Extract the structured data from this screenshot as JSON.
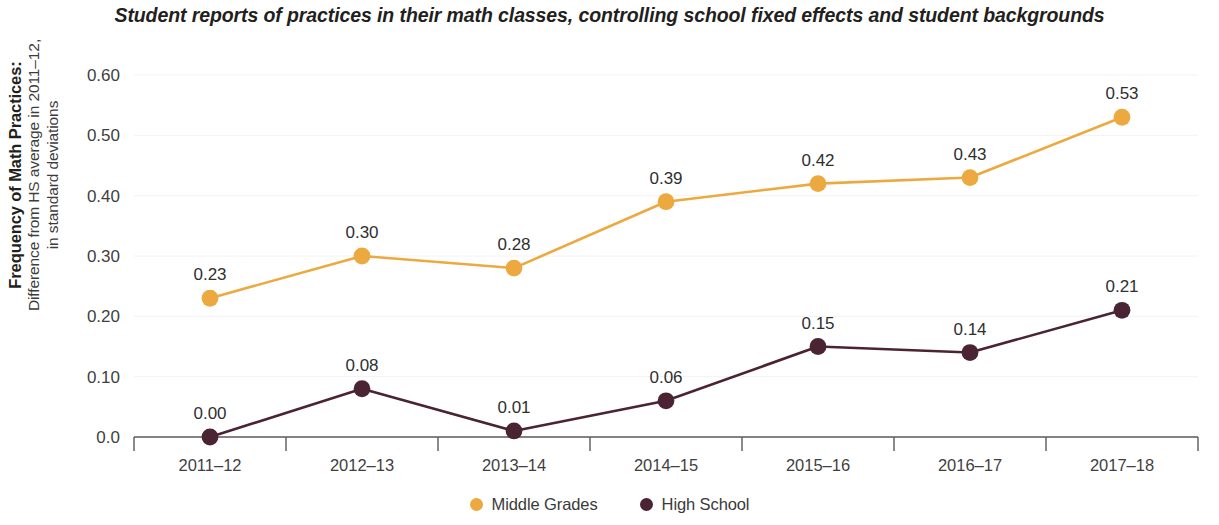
{
  "title": "Student reports of practices in their math classes, controlling school fixed effects and student backgrounds",
  "y_axis_title": {
    "line1": "Frequency of Math Practices:",
    "line2": "Difference from HS average in 2011–12,",
    "line3": "in standard deviations"
  },
  "legend": {
    "items": [
      {
        "label": "Middle Grades",
        "color": "#eca93f"
      },
      {
        "label": "High School",
        "color": "#4a2433"
      }
    ]
  },
  "chart_data": {
    "type": "line",
    "title": "Student reports of practices in their math classes, controlling school fixed effects and student backgrounds",
    "xlabel": "",
    "ylabel": "Frequency of Math Practices: Difference from HS average in 2011–12, in standard deviations",
    "categories": [
      "2011–12",
      "2012–13",
      "2013–14",
      "2014–15",
      "2015–16",
      "2016–17",
      "2017–18"
    ],
    "ylim": [
      0.0,
      0.6
    ],
    "yticks": [
      0.0,
      0.1,
      0.2,
      0.3,
      0.4,
      0.5,
      0.6
    ],
    "ytick_labels": [
      "0.0",
      "0.10",
      "0.20",
      "0.30",
      "0.40",
      "0.50",
      "0.60"
    ],
    "grid": true,
    "legend_position": "bottom",
    "series": [
      {
        "name": "Middle Grades",
        "color": "#eca93f",
        "values": [
          0.23,
          0.3,
          0.28,
          0.39,
          0.42,
          0.43,
          0.53
        ],
        "labels": [
          "0.23",
          "0.30",
          "0.28",
          "0.39",
          "0.42",
          "0.43",
          "0.53"
        ]
      },
      {
        "name": "High School",
        "color": "#4a2433",
        "values": [
          0.0,
          0.08,
          0.01,
          0.06,
          0.15,
          0.14,
          0.21
        ],
        "labels": [
          "0.00",
          "0.08",
          "0.01",
          "0.06",
          "0.15",
          "0.14",
          "0.21"
        ]
      }
    ]
  }
}
